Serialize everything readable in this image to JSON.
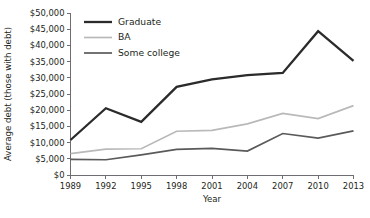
{
  "chart_data": {
    "type": "line",
    "title": "",
    "xlabel": "Year",
    "ylabel": "Average debt (those with debt)",
    "categories": [
      "1989",
      "1992",
      "1995",
      "1998",
      "2001",
      "2004",
      "2007",
      "2010",
      "2013"
    ],
    "x": [
      1989,
      1992,
      1995,
      1998,
      2001,
      2004,
      2007,
      2010,
      2013
    ],
    "ylim": [
      0,
      50000
    ],
    "xlim": [
      1989,
      2013
    ],
    "grid": false,
    "legend_position": "top-left",
    "ytick_labels": [
      "$0",
      "$5,000",
      "$10,000",
      "$15,000",
      "$20,000",
      "$25,000",
      "$30,000",
      "$35,000",
      "$40,000",
      "$45,000",
      "$50,000"
    ],
    "ytick_values": [
      0,
      5000,
      10000,
      15000,
      20000,
      25000,
      30000,
      35000,
      40000,
      45000,
      50000
    ],
    "series": [
      {
        "name": "Graduate",
        "color": "#2b2b2b",
        "width": 2.3,
        "values": [
          10800,
          20600,
          16400,
          27200,
          29500,
          30800,
          31500,
          44400,
          35200
        ]
      },
      {
        "name": "BA",
        "color": "#b9b9b9",
        "width": 1.7,
        "values": [
          6600,
          8000,
          8100,
          13500,
          13800,
          15800,
          19000,
          17400,
          21400
        ]
      },
      {
        "name": "Some college",
        "color": "#5a5a5a",
        "width": 1.7,
        "values": [
          4800,
          4700,
          6200,
          7900,
          8200,
          7400,
          12800,
          11400,
          13600
        ]
      }
    ]
  },
  "axis": {
    "axis_color": "#6d6e71"
  }
}
